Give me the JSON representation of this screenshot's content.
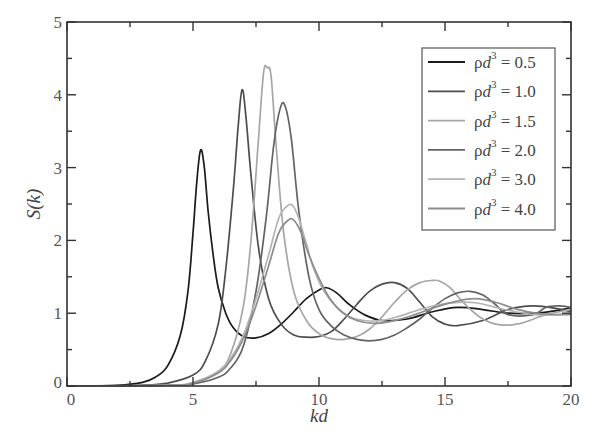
{
  "chart_data": {
    "type": "line",
    "title": "",
    "xlabel": "kd",
    "ylabel": "S(k)",
    "xlim": [
      0,
      20
    ],
    "ylim": [
      0,
      5
    ],
    "xticks": [
      0,
      5,
      10,
      15,
      20
    ],
    "yticks": [
      0,
      1,
      2,
      3,
      4,
      5
    ],
    "grid": false,
    "legend_position": "upper right",
    "series": [
      {
        "name": "ρd³ = 0.5",
        "color": "#1a1a1a",
        "x": [
          0,
          2,
          3,
          3.5,
          4,
          4.5,
          4.8,
          5.0,
          5.15,
          5.3,
          5.45,
          5.6,
          5.8,
          6.0,
          6.3,
          6.6,
          7.0,
          7.5,
          8.0,
          8.5,
          9.0,
          9.5,
          10.0,
          10.3,
          10.7,
          11.2,
          11.8,
          12.5,
          13.5,
          14.5,
          15.5,
          16.5,
          17.5,
          18.5,
          19.5,
          20
        ],
        "y": [
          0,
          0.01,
          0.05,
          0.12,
          0.28,
          0.7,
          1.3,
          2.1,
          2.8,
          3.24,
          3.0,
          2.4,
          1.8,
          1.35,
          1.0,
          0.8,
          0.68,
          0.66,
          0.72,
          0.85,
          1.02,
          1.2,
          1.32,
          1.35,
          1.28,
          1.12,
          0.98,
          0.9,
          0.92,
          1.02,
          1.08,
          1.05,
          1.0,
          1.0,
          1.04,
          1.08
        ]
      },
      {
        "name": "ρd³ = 1.0",
        "color": "#4d4d4d",
        "x": [
          0,
          3,
          4,
          5,
          5.5,
          6.0,
          6.3,
          6.6,
          6.8,
          6.95,
          7.1,
          7.3,
          7.6,
          8.0,
          8.5,
          9.0,
          9.5,
          10.0,
          10.5,
          11.0,
          11.5,
          12.0,
          12.5,
          13.0,
          13.5,
          14.0,
          14.5,
          15.0,
          15.5,
          16.5,
          17.5,
          18.5,
          19.5,
          20
        ],
        "y": [
          0,
          0.01,
          0.04,
          0.15,
          0.35,
          0.85,
          1.6,
          2.7,
          3.6,
          4.07,
          3.7,
          2.9,
          1.9,
          1.2,
          0.85,
          0.7,
          0.67,
          0.68,
          0.75,
          0.92,
          1.12,
          1.3,
          1.4,
          1.42,
          1.34,
          1.15,
          0.95,
          0.85,
          0.83,
          0.9,
          1.05,
          1.1,
          1.06,
          1.02
        ]
      },
      {
        "name": "ρd³ = 1.5",
        "color": "#a6a6a6",
        "x": [
          0,
          4,
          5,
          6,
          6.5,
          7.0,
          7.3,
          7.6,
          7.8,
          7.95,
          8.1,
          8.3,
          8.6,
          9.0,
          9.5,
          10.0,
          10.5,
          11.0,
          11.5,
          12.0,
          12.5,
          13.0,
          13.5,
          14.0,
          14.5,
          14.8,
          15.2,
          15.8,
          16.5,
          17.2,
          18.0,
          19.0,
          20
        ],
        "y": [
          0,
          0.01,
          0.04,
          0.2,
          0.45,
          1.1,
          2.0,
          3.4,
          4.3,
          4.37,
          4.25,
          3.3,
          2.1,
          1.3,
          0.9,
          0.72,
          0.65,
          0.64,
          0.68,
          0.78,
          0.95,
          1.15,
          1.32,
          1.42,
          1.45,
          1.44,
          1.35,
          1.12,
          0.92,
          0.84,
          0.86,
          0.98,
          1.05
        ]
      },
      {
        "name": "ρd³ = 2.0",
        "color": "#636363",
        "x": [
          0,
          4,
          5,
          6,
          6.5,
          7.0,
          7.5,
          7.9,
          8.2,
          8.45,
          8.65,
          8.9,
          9.2,
          9.6,
          10.0,
          10.5,
          11.0,
          11.5,
          12.0,
          12.5,
          13.0,
          13.5,
          14.0,
          14.5,
          15.0,
          15.5,
          16.0,
          16.5,
          17.0,
          17.5,
          18.5,
          19.0,
          19.5,
          20
        ],
        "y": [
          0,
          0.01,
          0.03,
          0.12,
          0.25,
          0.55,
          1.3,
          2.3,
          3.3,
          3.8,
          3.85,
          3.4,
          2.4,
          1.5,
          1.05,
          0.82,
          0.7,
          0.64,
          0.62,
          0.64,
          0.7,
          0.8,
          0.92,
          1.07,
          1.2,
          1.28,
          1.3,
          1.25,
          1.12,
          0.98,
          0.98,
          1.08,
          1.1,
          1.08
        ]
      },
      {
        "name": "ρd³ = 3.0",
        "color": "#b3b3b3",
        "x": [
          0,
          4,
          5,
          6,
          6.5,
          7.0,
          7.5,
          8.0,
          8.4,
          8.7,
          8.95,
          9.2,
          9.5,
          9.8,
          10.2,
          10.7,
          11.2,
          11.8,
          12.5,
          13.2,
          14.0,
          14.8,
          15.5,
          16.3,
          17.0,
          17.8,
          18.6,
          19.3,
          20
        ],
        "y": [
          0,
          0.01,
          0.05,
          0.2,
          0.38,
          0.7,
          1.2,
          1.8,
          2.3,
          2.46,
          2.48,
          2.3,
          1.95,
          1.6,
          1.3,
          1.08,
          0.95,
          0.9,
          0.9,
          0.96,
          1.05,
          1.12,
          1.15,
          1.14,
          1.08,
          1.02,
          0.98,
          0.98,
          1.0
        ]
      },
      {
        "name": "ρd³ = 4.0",
        "color": "#8c8c8c",
        "x": [
          0,
          4,
          5,
          6,
          6.5,
          7.0,
          7.5,
          8.0,
          8.4,
          8.75,
          9.0,
          9.3,
          9.6,
          10.0,
          10.4,
          10.9,
          11.5,
          12.2,
          13.0,
          13.8,
          14.6,
          15.4,
          16.2,
          17.0,
          17.8,
          18.6,
          19.3,
          20
        ],
        "y": [
          0,
          0.01,
          0.04,
          0.18,
          0.35,
          0.65,
          1.1,
          1.65,
          2.1,
          2.27,
          2.28,
          2.1,
          1.8,
          1.48,
          1.22,
          1.02,
          0.9,
          0.86,
          0.9,
          0.98,
          1.08,
          1.16,
          1.2,
          1.15,
          1.06,
          1.0,
          0.98,
          0.98
        ]
      }
    ]
  },
  "legend": {
    "items": [
      {
        "prefix": "ρ",
        "var": "d",
        "sup": "3",
        "value": "= 0.5"
      },
      {
        "prefix": "ρ",
        "var": "d",
        "sup": "3",
        "value": "= 1.0"
      },
      {
        "prefix": "ρ",
        "var": "d",
        "sup": "3",
        "value": "= 1.5"
      },
      {
        "prefix": "ρ",
        "var": "d",
        "sup": "3",
        "value": "= 2.0"
      },
      {
        "prefix": "ρ",
        "var": "d",
        "sup": "3",
        "value": "= 3.0"
      },
      {
        "prefix": "ρ",
        "var": "d",
        "sup": "3",
        "value": "= 4.0"
      }
    ]
  },
  "axes": {
    "xlabel": "kd",
    "ylabel": "S(k)",
    "xtick_labels": [
      "0",
      "5",
      "10",
      "15",
      "20"
    ],
    "ytick_labels": [
      "0",
      "1",
      "2",
      "3",
      "4",
      "5"
    ]
  }
}
